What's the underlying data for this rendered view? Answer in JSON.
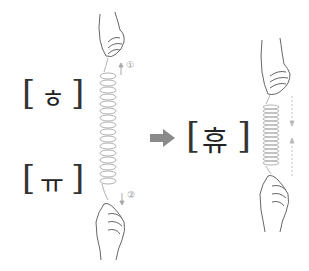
{
  "diagram": {
    "left": {
      "top_syllable": "ㅎ",
      "bottom_syllable": "ㅠ",
      "marker_up": "①",
      "marker_down": "②"
    },
    "arrow": "right-arrow",
    "right": {
      "result_syllable": "휴"
    },
    "brackets": {
      "open": "[",
      "close": "]"
    },
    "colors": {
      "spring": "#a0a0a0",
      "arrow": "#8a8a8a",
      "text": "#222222",
      "marker": "#999999"
    }
  }
}
